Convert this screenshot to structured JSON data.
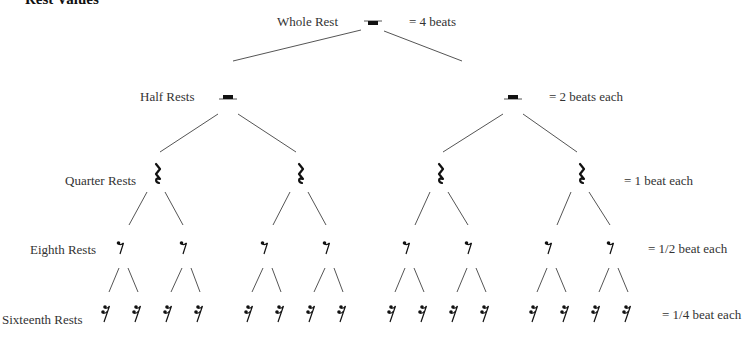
{
  "title": "Rest Values",
  "levels": [
    {
      "name": "Whole Rest",
      "value": "=  4 beats",
      "label_pos": [
        277,
        15
      ],
      "value_pos": [
        409,
        15
      ],
      "glyph": "whole-rest",
      "y": 22
    },
    {
      "name": "Half Rests",
      "value": "=  2 beats each",
      "label_pos": [
        140,
        90
      ],
      "value_pos": [
        549,
        90
      ],
      "glyph": "half-rest",
      "y": 97
    },
    {
      "name": "Quarter Rests",
      "value": "=  1 beat each",
      "label_pos": [
        65,
        174
      ],
      "value_pos": [
        624,
        174
      ],
      "glyph": "quarter-rest",
      "y": 175
    },
    {
      "name": "Eighth Rests",
      "value": "=  1/2 beat each",
      "label_pos": [
        30,
        243
      ],
      "value_pos": [
        648,
        242
      ],
      "glyph": "eighth-rest",
      "y": 246
    },
    {
      "name": "Sixteenth Rests",
      "value": "=  1/4 beat each",
      "label_pos": [
        2,
        313
      ],
      "value_pos": [
        662,
        308
      ],
      "glyph": "sixteenth-rest",
      "y": 314
    }
  ],
  "glyph_positions": {
    "whole": [
      373
    ],
    "half": [
      228,
      513
    ],
    "quarter": [
      158,
      301,
      441,
      582
    ],
    "eighth": [
      121,
      184,
      265,
      327,
      407,
      469,
      549,
      611
    ],
    "sixteenth": [
      106,
      137,
      168,
      199,
      249,
      280,
      311,
      342,
      392,
      423,
      454,
      485,
      534,
      565,
      596,
      627
    ]
  },
  "colors": {
    "ink": "#111111",
    "line": "#555555",
    "text": "#333333"
  }
}
